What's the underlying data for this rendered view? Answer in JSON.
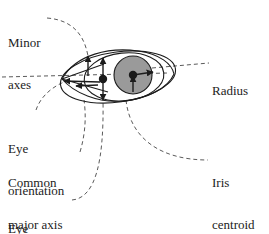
{
  "figure": {
    "width": 269,
    "height": 234,
    "background_color": "#ffffff",
    "line_color": "#1c1c1c",
    "iris_fill_color": "#999999",
    "pupil_fill_color": "#1a1a1a",
    "leader_style": "dashed"
  },
  "labels": {
    "minor_axes": {
      "line1": "Minor",
      "line2": "axes"
    },
    "radius": {
      "line1": "Radius",
      "line2": ""
    },
    "eye_orientation": {
      "line1": "Eye",
      "line2": "orientation"
    },
    "common_major_axis": {
      "line1": "Common",
      "line2": "major axis"
    },
    "iris_centroid": {
      "line1": "Iris",
      "line2": "centroid"
    },
    "eye_centroid": {
      "line1": "Eye",
      "line2": "centroid"
    }
  },
  "diagram": {
    "eye_outline": "almond-shaped eye contour",
    "eye_ellipse": "fitted ellipse of the eye region",
    "iris_circle": "gray filled iris disc",
    "pupil_dot": "dark pupil centroid marker",
    "eye_centroid_dot": "dark eye centroid marker",
    "radius_arrow": "arrow from iris centroid to iris boundary",
    "major_axis_arrows": "double arrowheads along common major axis",
    "minor_axis_arrows": "double arrowheads along minor axes"
  }
}
